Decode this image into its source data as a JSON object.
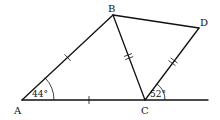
{
  "diagram": {
    "type": "geometry",
    "points": {
      "A": {
        "label": "A",
        "x": 22,
        "y": 100
      },
      "B": {
        "label": "B",
        "x": 113,
        "y": 15
      },
      "C": {
        "label": "C",
        "x": 145,
        "y": 100
      },
      "D": {
        "label": "D",
        "x": 199,
        "y": 28
      }
    },
    "segments": [
      {
        "from": "A",
        "to": "B",
        "ticks": 1
      },
      {
        "from": "A",
        "to": "C",
        "ticks": 1
      },
      {
        "from": "B",
        "to": "C",
        "ticks": 2
      },
      {
        "from": "C",
        "to": "D",
        "ticks": 2
      },
      {
        "from": "B",
        "to": "D",
        "ticks": 0
      },
      {
        "from": "C",
        "to": "baseline-end",
        "ticks": 0
      }
    ],
    "angles": [
      {
        "vertex": "A",
        "label": "44°",
        "between": [
          "AC",
          "AB"
        ]
      },
      {
        "vertex": "C",
        "label": "52°",
        "between": [
          "C-baseline-right",
          "CD"
        ]
      }
    ],
    "stroke_color": "#111111",
    "background": "#ffffff"
  }
}
